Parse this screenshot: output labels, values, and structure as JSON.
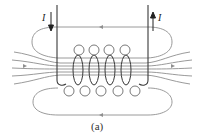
{
  "figure": {
    "caption": "(a)",
    "current_left_label": "I",
    "current_right_label": "I",
    "colors": {
      "wire": "#3a3a3a",
      "field": "#8a8a8a",
      "background": "#ffffff"
    }
  }
}
